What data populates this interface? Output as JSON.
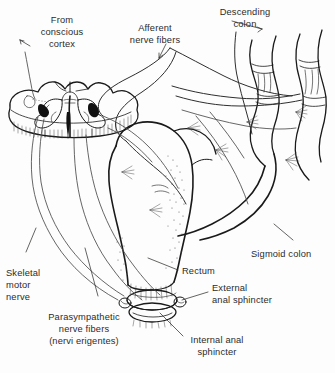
{
  "figure": {
    "background_color": "#fdfdfd",
    "ink_color": "#1a1a1a",
    "text_color": "#2b2b2b"
  },
  "labels": {
    "from_conscious_cortex": {
      "line1": "From",
      "line2": "conscious",
      "line3": "cortex"
    },
    "afferent_nerve_fibers": {
      "line1": "Afferent",
      "line2": "nerve fibers"
    },
    "descending_colon": {
      "line1": "Descending",
      "line2": "colon"
    },
    "sigmoid_colon": {
      "line1": "Sigmoid colon"
    },
    "rectum": {
      "line1": "Rectum"
    },
    "external_anal_sphincter": {
      "line1": "External",
      "line2": "anal sphincter"
    },
    "internal_anal_sphincter": {
      "line1": "Internal anal",
      "line2": "sphincter"
    },
    "skeletal_motor_nerve": {
      "line1": "Skeletal",
      "line2": "motor",
      "line3": "nerve"
    },
    "parasympathetic_nerve_fibers": {
      "line1": "Parasympathetic",
      "line2": "nerve fibers",
      "line3": "(nervi erigentes)"
    }
  },
  "structures": {
    "spinal_cord": "spinal-cord-cross-section",
    "gray_matter": "butterfly-gray-matter",
    "motor_neurons": "dark-neuron-cell-bodies",
    "colon": "descending-and-sigmoid-colon",
    "rectum": "rectum",
    "sphincters": "anal-sphincter-ring"
  }
}
